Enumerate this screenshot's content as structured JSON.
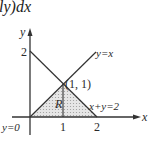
{
  "header_fragment": "ly)dx",
  "diagram": {
    "type": "region-of-integration",
    "axes": {
      "x_label": "x",
      "y_label": "y"
    },
    "ticks": {
      "x": [
        "1",
        "2"
      ],
      "y": [
        "2"
      ]
    },
    "lines": [
      {
        "label": "y=x",
        "equation": "y = x"
      },
      {
        "label": "x+y=2",
        "equation": "x + y = 2"
      },
      {
        "label": "y=0",
        "equation": "y = 0"
      }
    ],
    "intersection_point": "(1, 1)",
    "region_label": "R",
    "region_vertices": [
      [
        0,
        0
      ],
      [
        1,
        1
      ],
      [
        2,
        0
      ]
    ],
    "colors": {
      "lines": "#333333",
      "region_fill": "#d9d9d9",
      "hatch": "#9a9a9a"
    }
  }
}
